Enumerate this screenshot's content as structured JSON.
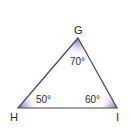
{
  "diagram": {
    "type": "triangle",
    "colors": {
      "edge": "#4a3f6b",
      "angle_fill": "#8a7fb0",
      "text": "#2a2a2a"
    },
    "vertices": [
      {
        "label": "G",
        "x": 78,
        "y": 38
      },
      {
        "label": "H",
        "x": 18,
        "y": 108
      },
      {
        "label": "I",
        "x": 117,
        "y": 108
      }
    ],
    "angles": [
      {
        "vertex": "G",
        "label": "70°"
      },
      {
        "vertex": "H",
        "label": "50°"
      },
      {
        "vertex": "I",
        "label": "60°"
      }
    ]
  }
}
